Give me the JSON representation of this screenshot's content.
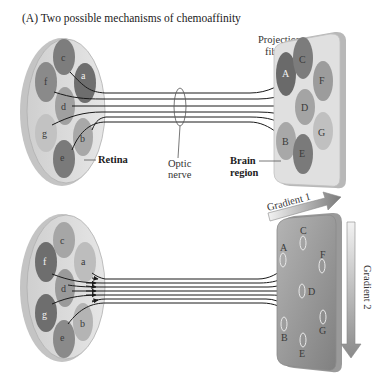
{
  "figure": {
    "title": "(A) Two possible mechanisms of chemoaffinity",
    "top_panel": {
      "retina_label": "Retina",
      "optic_nerve_label_line1": "Optic",
      "optic_nerve_label_line2": "nerve",
      "projection_label_line1": "Projection",
      "projection_label_line2": "fibers",
      "brain_label_line1": "Brain",
      "brain_label_line2": "region",
      "retina_sites": [
        "a",
        "b",
        "c",
        "d",
        "e",
        "f",
        "g"
      ],
      "brain_sites": [
        "A",
        "B",
        "C",
        "D",
        "E",
        "F",
        "G"
      ]
    },
    "bottom_panel": {
      "gradient1_label": "Gradient 1",
      "gradient2_label": "Gradient 2",
      "retina_sites": [
        "a",
        "b",
        "c",
        "d",
        "e",
        "f",
        "g"
      ],
      "brain_sites": [
        "A",
        "B",
        "C",
        "D",
        "E",
        "F",
        "G"
      ]
    },
    "colors": {
      "disc_fill": "#dcdcdc",
      "disc_edge": "#bdbdbd",
      "site_dark": "#7a7a7a",
      "site_mid": "#9a9a9a",
      "site_light": "#bcbcbc",
      "brain_top": "#e2e2e2",
      "brain_bottom_dark": "#8c8c8c",
      "fiber": "#1a1a1a"
    }
  }
}
